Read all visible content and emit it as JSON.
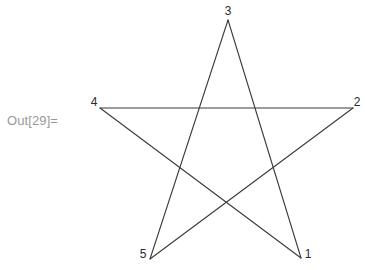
{
  "output_cell": {
    "label": "Out[29]=",
    "label_color": "#999999"
  },
  "chart_data": {
    "type": "scatter",
    "title": "",
    "subtitle": "",
    "xlabel": "",
    "ylabel": "",
    "grid": false,
    "legend": null,
    "axes_visible": false,
    "line_color": "#3a3a3a",
    "line_width": 1.1,
    "background_color": "#ffffff",
    "vertices": [
      {
        "label": "1",
        "x": 301,
        "y": 258,
        "label_x": 308,
        "label_y": 255
      },
      {
        "label": "2",
        "x": 353,
        "y": 108,
        "label_x": 357,
        "label_y": 103
      },
      {
        "label": "3",
        "x": 228,
        "y": 20,
        "label_x": 228,
        "label_y": 12
      },
      {
        "label": "4",
        "x": 100,
        "y": 108,
        "label_x": 94,
        "label_y": 103
      },
      {
        "label": "5",
        "x": 150,
        "y": 259,
        "label_x": 143,
        "label_y": 255
      }
    ],
    "edges": [
      {
        "from": "1",
        "to": "3"
      },
      {
        "from": "3",
        "to": "5"
      },
      {
        "from": "5",
        "to": "2"
      },
      {
        "from": "2",
        "to": "4"
      },
      {
        "from": "4",
        "to": "1"
      }
    ],
    "xlim": [
      94,
      365
    ],
    "ylim": [
      12,
      265
    ]
  }
}
